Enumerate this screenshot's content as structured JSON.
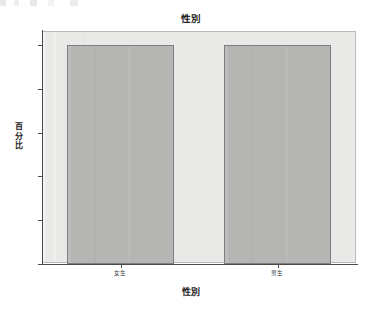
{
  "chart_data": {
    "type": "bar",
    "title": "性別",
    "xlabel": "性別",
    "ylabel": "百分比",
    "categories": [
      "女生",
      "男生"
    ],
    "values": [
      50,
      50
    ],
    "ylim": [
      0,
      50
    ],
    "yticks": [
      "0",
      "10",
      "20",
      "30",
      "40",
      "50"
    ],
    "ytick_values": [
      0,
      10,
      20,
      30,
      40,
      50
    ],
    "grid": false,
    "legend": false,
    "legend_position": "none",
    "series": [
      {
        "name": "百分比",
        "values": [
          50,
          50
        ]
      }
    ],
    "annotations": []
  },
  "style": {
    "bar_fill": "#b5b5b4",
    "bar_edge": "#7e7e7e",
    "plot_background": "#e9e9e7",
    "plot_border": "#b9b9b7",
    "axis_color": "#4a4a4a",
    "text_color": "#232323",
    "page_background": "#ffffff"
  }
}
